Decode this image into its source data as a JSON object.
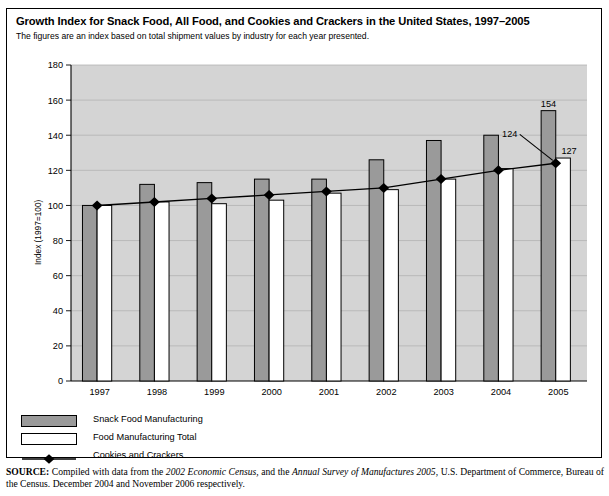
{
  "header_fragment": "",
  "title": "Growth Index for Snack Food, All Food, and Cookies and Crackers in the United States, 1997–2005",
  "subtitle": "The figures are an index based on total shipment values by industry for each year presented.",
  "legend": {
    "items": [
      {
        "label": "Snack Food Manufacturing",
        "marker": "gray-swatch",
        "color": "#9a9a9a"
      },
      {
        "label": "Food Manufacturing Total",
        "marker": "white-swatch",
        "color": "#ffffff"
      },
      {
        "label": "Cookies and Crackers",
        "marker": "diamond-line",
        "color": "#000000"
      }
    ]
  },
  "source": {
    "prefix": "SOURCE:",
    "t1": " Compiled with data from the ",
    "i1": "2002 Economic Census,",
    "t2": " and the ",
    "i2": "Annual Survey of Manufactures 2005",
    "t3": ", U.S. Department of  Commerce, Bureau of the Census. December 2004 and November 2006 respectively."
  },
  "chart_data": {
    "type": "bar",
    "title": "Growth Index for Snack Food, All Food, and Cookies and Crackers in the United States, 1997–2005",
    "subtitle": "The figures are an index based on total shipment values by industry for each year presented.",
    "xlabel": "",
    "ylabel": "Index (1997=100)",
    "ylim": [
      0,
      180
    ],
    "yticks": [
      0,
      20,
      40,
      60,
      80,
      100,
      120,
      140,
      160,
      180
    ],
    "grid": true,
    "legend_position": "below-left",
    "categories": [
      "1997",
      "1998",
      "1999",
      "2000",
      "2001",
      "2002",
      "2003",
      "2004",
      "2005"
    ],
    "series": [
      {
        "name": "Snack Food Manufacturing",
        "type": "bar",
        "color": "#9a9a9a",
        "values": [
          100,
          112,
          113,
          115,
          115,
          126,
          137,
          140,
          154
        ]
      },
      {
        "name": "Food Manufacturing Total",
        "type": "bar",
        "color": "#ffffff",
        "values": [
          100,
          102,
          101,
          103,
          107,
          109,
          115,
          121,
          127
        ]
      },
      {
        "name": "Cookies and Crackers",
        "type": "line",
        "color": "#000000",
        "values": [
          100,
          102,
          104,
          106,
          108,
          110,
          115,
          120,
          124
        ]
      }
    ],
    "annotations": [
      {
        "text": "154",
        "series": "Snack Food Manufacturing",
        "category": "2005",
        "value": 154
      },
      {
        "text": "124",
        "series": "Cookies and Crackers",
        "category": "2005",
        "value": 124,
        "leader_line": true
      },
      {
        "text": "127",
        "series": "Food Manufacturing Total",
        "category": "2005",
        "value": 127
      }
    ]
  }
}
